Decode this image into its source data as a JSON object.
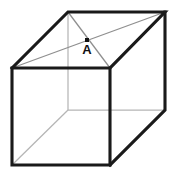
{
  "figure": {
    "kind": "geometric-solid",
    "shape_name": "cube",
    "projection": "oblique",
    "canvas": {
      "width": 178,
      "height": 179,
      "background": "#ffffff"
    },
    "colors": {
      "visible_edge": "#1a1a1a",
      "hidden_edge": "#b5b5b5",
      "diagonal": "#8f8f8f",
      "face": "#ffffff",
      "label": "#111111",
      "marker": "#111111"
    },
    "stroke_widths": {
      "visible_edge": 3.1,
      "hidden_edge": 1.25,
      "diagonal": 1.3
    },
    "vertices": {
      "front_top_left": {
        "x": 12,
        "y": 68
      },
      "front_top_right": {
        "x": 110,
        "y": 68
      },
      "front_bottom_right": {
        "x": 110,
        "y": 165
      },
      "front_bottom_left": {
        "x": 12,
        "y": 165
      },
      "back_top_left": {
        "x": 68,
        "y": 12
      },
      "back_top_right": {
        "x": 165,
        "y": 12
      },
      "back_bottom_right": {
        "x": 165,
        "y": 110
      },
      "back_bottom_left": {
        "x": 68,
        "y": 110
      }
    },
    "visible_edge_paths": [
      "M 12 68 L 110 68 L 110 165 L 12 165 Z",
      "M 12 68 L 68 12 L 165 12 L 110 68",
      "M 165 12 L 165 110 L 110 165"
    ],
    "hidden_edge_paths": [
      "M 68 12 L 68 110",
      "M 68 110 L 165 110",
      "M 68 110 L 12 165"
    ],
    "diagonal_paths": [
      "M 12 68 L 165 12",
      "M 68 12 L 110 68"
    ],
    "point": {
      "id": "A",
      "label": "A",
      "x": 87,
      "y": 40,
      "marker_shape": "square",
      "marker_size": 4,
      "label_offset_x": 0,
      "label_offset_y": 14,
      "description": "intersection point of the top face diagonals"
    }
  }
}
